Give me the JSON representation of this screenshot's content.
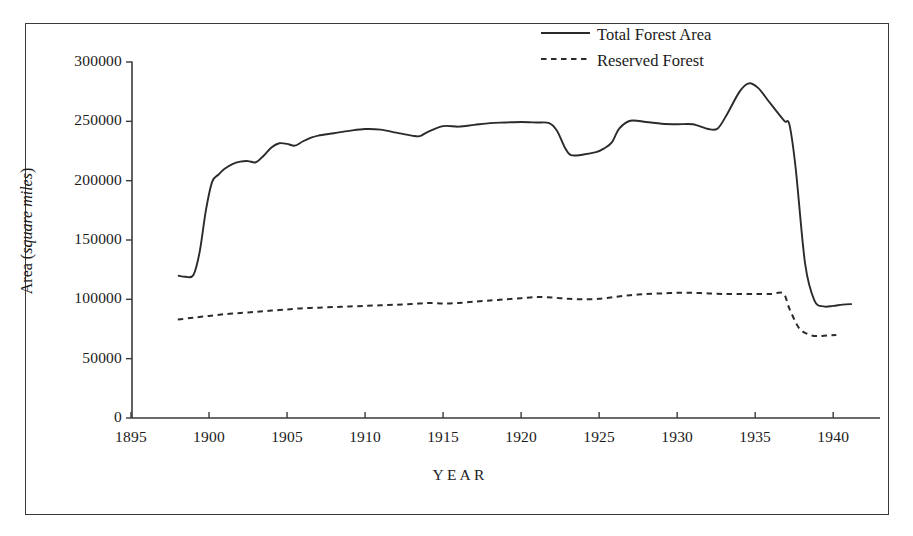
{
  "chart_data": {
    "type": "line",
    "title": "",
    "xlabel": "YEAR",
    "ylabel_plain": "Area (",
    "ylabel_italic": "square miles",
    "ylabel_close": ")",
    "ylabel_full": "Area (square miles)",
    "xlim": [
      1895,
      1943
    ],
    "ylim": [
      0,
      300000
    ],
    "xticks": [
      1895,
      1900,
      1905,
      1910,
      1915,
      1920,
      1925,
      1930,
      1935,
      1940
    ],
    "xtick_labels": [
      "1895",
      "1900",
      "1905",
      "1910",
      "1915",
      "1920",
      "1925",
      "1930",
      "1935",
      "1940"
    ],
    "yticks": [
      0,
      50000,
      100000,
      150000,
      200000,
      250000,
      300000
    ],
    "ytick_labels": [
      "0",
      "50000",
      "100000",
      "150000",
      "200000",
      "250000",
      "300000"
    ],
    "grid": false,
    "legend_position": "top-right",
    "line_color": "#2b2b2b",
    "axis_color": "#3a3a3a",
    "series": [
      {
        "name": "Total Forest Area",
        "style": "solid",
        "x": [
          1898.0,
          1898.5,
          1899.0,
          1899.4,
          1899.8,
          1900.2,
          1900.6,
          1901.0,
          1901.5,
          1902.0,
          1902.5,
          1903.0,
          1903.5,
          1904.0,
          1904.5,
          1905.0,
          1905.5,
          1906.0,
          1906.5,
          1907.0,
          1908.0,
          1909.0,
          1910.0,
          1911.0,
          1912.0,
          1913.0,
          1913.5,
          1914.0,
          1915.0,
          1916.0,
          1917.0,
          1918.0,
          1919.0,
          1920.0,
          1921.0,
          1921.8,
          1922.3,
          1922.8,
          1923.2,
          1924.0,
          1924.8,
          1925.3,
          1925.8,
          1926.3,
          1927.0,
          1928.0,
          1929.0,
          1930.0,
          1931.0,
          1932.0,
          1932.6,
          1933.2,
          1934.0,
          1934.6,
          1935.2,
          1935.8,
          1936.4,
          1936.9,
          1937.2,
          1937.6,
          1938.2,
          1938.8,
          1939.4,
          1940.0,
          1940.6,
          1941.2
        ],
        "y": [
          120000,
          119000,
          120500,
          140000,
          175000,
          199000,
          205000,
          210000,
          214000,
          216000,
          216500,
          215500,
          221000,
          228000,
          231500,
          231000,
          229500,
          233000,
          236000,
          238000,
          240000,
          242000,
          243500,
          243000,
          240500,
          238000,
          237500,
          241000,
          246000,
          245500,
          247000,
          248500,
          249000,
          249500,
          249000,
          248500,
          242000,
          228000,
          221500,
          222000,
          224000,
          227000,
          232000,
          244000,
          250500,
          249500,
          248000,
          247500,
          247500,
          243500,
          244000,
          256000,
          275000,
          282000,
          278000,
          268000,
          258000,
          250000,
          247000,
          210000,
          130000,
          99000,
          94000,
          94500,
          95500,
          96000
        ],
        "start_value": 120000,
        "peak_value": 282000,
        "peak_year": 1934.6,
        "end_value": 96000
      },
      {
        "name": "Reserved Forest",
        "style": "dashed",
        "x": [
          1898.0,
          1899.0,
          1900.0,
          1901.0,
          1902.0,
          1903.0,
          1904.0,
          1905.0,
          1906.0,
          1907.0,
          1908.0,
          1909.0,
          1910.0,
          1911.0,
          1912.0,
          1913.0,
          1914.0,
          1915.0,
          1916.0,
          1917.0,
          1918.0,
          1919.0,
          1920.0,
          1921.0,
          1922.0,
          1923.0,
          1924.0,
          1925.0,
          1926.0,
          1927.0,
          1928.0,
          1929.0,
          1930.0,
          1931.0,
          1932.0,
          1933.0,
          1934.0,
          1935.0,
          1936.0,
          1936.8,
          1937.2,
          1937.8,
          1938.4,
          1939.0,
          1939.6,
          1940.2
        ],
        "y": [
          83000,
          84500,
          86000,
          87500,
          88500,
          89500,
          90500,
          91500,
          92500,
          93000,
          93500,
          94000,
          94500,
          95000,
          95500,
          96000,
          97000,
          96500,
          97000,
          98000,
          99000,
          100000,
          101000,
          102000,
          101500,
          100500,
          100000,
          100500,
          102000,
          103500,
          104500,
          105000,
          105500,
          105500,
          105000,
          104500,
          104500,
          104500,
          104500,
          105000,
          92000,
          76000,
          70500,
          69000,
          69500,
          70000
        ],
        "start_value": 83000,
        "end_value": 70000
      }
    ]
  },
  "legend": {
    "entries": [
      {
        "label": "Total Forest Area",
        "style": "solid"
      },
      {
        "label": "Reserved Forest",
        "style": "dashed"
      }
    ]
  }
}
